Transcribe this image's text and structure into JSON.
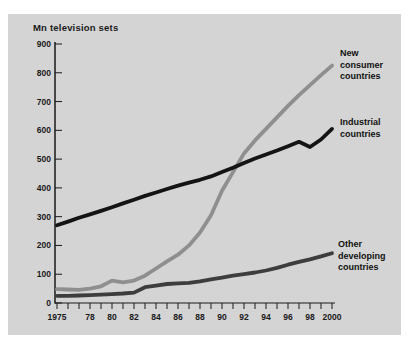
{
  "chart_data": {
    "type": "line",
    "title": "Mn television sets",
    "xlabel": "",
    "ylabel": "Mn television sets",
    "ylim": [
      0,
      900
    ],
    "ytick_step": 100,
    "grid": false,
    "legend_position": "right-inline",
    "background_color": "#d4d4d4",
    "axis_color": "#1a1a1a",
    "x": [
      1975,
      1976,
      1977,
      1978,
      1979,
      1980,
      1981,
      1982,
      1983,
      1984,
      1985,
      1986,
      1987,
      1988,
      1989,
      1990,
      1991,
      1992,
      1993,
      1994,
      1995,
      1996,
      1997,
      1998,
      1999,
      2000
    ],
    "x_tick_labels": [
      "1975",
      "78",
      "80",
      "82",
      "84",
      "86",
      "88",
      "90",
      "92",
      "94",
      "96",
      "98",
      "2000"
    ],
    "series": [
      {
        "name": "New consumer countries",
        "legend_label": "New\nconsumer\ncountries",
        "color": "#8f8f8f",
        "width": 3.8,
        "values": [
          48,
          47,
          46,
          50,
          58,
          78,
          72,
          78,
          95,
          120,
          145,
          168,
          200,
          245,
          305,
          390,
          455,
          520,
          565,
          605,
          645,
          685,
          722,
          757,
          792,
          825
        ]
      },
      {
        "name": "Other developing countries",
        "legend_label": "Other\ndeveloping\ncountries",
        "color": "#3d3d3d",
        "width": 3.8,
        "values": [
          25,
          25,
          26,
          27,
          29,
          31,
          33,
          36,
          55,
          60,
          66,
          68,
          70,
          75,
          82,
          88,
          95,
          100,
          106,
          113,
          122,
          133,
          143,
          152,
          162,
          173
        ]
      },
      {
        "name": "Industrial countries",
        "legend_label": "Industrial\ncountries",
        "color": "#141414",
        "width": 3.8,
        "values": [
          270,
          283,
          296,
          308,
          320,
          333,
          346,
          359,
          372,
          384,
          396,
          408,
          418,
          428,
          440,
          455,
          470,
          487,
          502,
          516,
          530,
          545,
          560,
          542,
          568,
          605
        ]
      }
    ],
    "plot": {
      "axis_x": 47,
      "left": 49,
      "right": 324,
      "top": 30,
      "bottom": 289
    }
  }
}
